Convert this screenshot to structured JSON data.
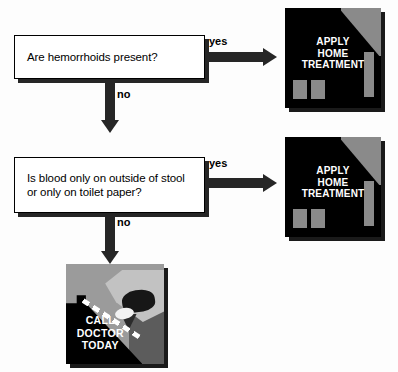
{
  "diagram": {
    "type": "flowchart",
    "colors": {
      "box_fill": "#ffffff",
      "box_border": "#000000",
      "shadow": "#262626",
      "arrow": "#262626",
      "panel_dark": "#000000",
      "panel_gray": "#8a8a8a",
      "panel_mid_gray": "#9b9b9b",
      "caption_text": "#ffffff"
    },
    "questions": [
      {
        "id": "q1",
        "text": "Are hemorrhoids present?",
        "yes_label": "yes",
        "no_label": "no"
      },
      {
        "id": "q2",
        "line1": "Is blood only on outside of stool",
        "line2": "or only on toilet paper?",
        "yes_label": "yes",
        "no_label": "no"
      }
    ],
    "outcomes": [
      {
        "id": "outcome-apply-home-treatment-1",
        "icon": "house-icon",
        "caption_lines": [
          "APPLY",
          "HOME",
          "TREATMENT"
        ]
      },
      {
        "id": "outcome-apply-home-treatment-2",
        "icon": "house-icon",
        "caption_lines": [
          "APPLY",
          "HOME",
          "TREATMENT"
        ]
      },
      {
        "id": "outcome-call-doctor-today",
        "icon": "telephone-hand-icon",
        "caption_lines": [
          "CALL",
          "DOCTOR",
          "TODAY"
        ]
      }
    ]
  }
}
